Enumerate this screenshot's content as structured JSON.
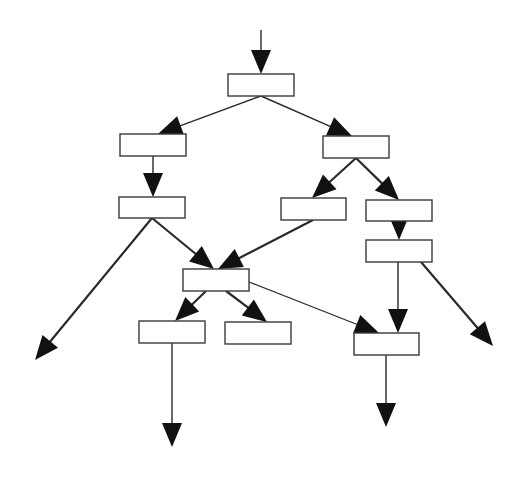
{
  "diagram": {
    "type": "flowchart-tree",
    "background": "#ffffff",
    "stroke_color": "#2a2a2a",
    "arrow_color": "#111111",
    "nodes": [
      {
        "id": "n1",
        "label": "",
        "x": 228,
        "y": 74,
        "w": 66,
        "h": 22
      },
      {
        "id": "n2",
        "label": "",
        "x": 120,
        "y": 134,
        "w": 66,
        "h": 22
      },
      {
        "id": "n3",
        "label": "",
        "x": 323,
        "y": 136,
        "w": 66,
        "h": 22
      },
      {
        "id": "n4",
        "label": "",
        "x": 119,
        "y": 197,
        "w": 66,
        "h": 21
      },
      {
        "id": "n5",
        "label": "",
        "x": 281,
        "y": 198,
        "w": 65,
        "h": 22
      },
      {
        "id": "n6",
        "label": "",
        "x": 366,
        "y": 200,
        "w": 66,
        "h": 21
      },
      {
        "id": "n7",
        "label": "",
        "x": 366,
        "y": 240,
        "w": 66,
        "h": 22
      },
      {
        "id": "n8",
        "label": "",
        "x": 183,
        "y": 269,
        "w": 66,
        "h": 22
      },
      {
        "id": "n9",
        "label": "",
        "x": 139,
        "y": 321,
        "w": 66,
        "h": 22
      },
      {
        "id": "n10",
        "label": "",
        "x": 225,
        "y": 322,
        "w": 66,
        "h": 22
      },
      {
        "id": "n11",
        "label": "",
        "x": 354,
        "y": 333,
        "w": 65,
        "h": 22
      }
    ],
    "edges": [
      {
        "from": "entry",
        "x1": 261,
        "y1": 30,
        "x2": 261,
        "y2": 74,
        "width": 1.4,
        "head": true
      },
      {
        "from": "n1",
        "to": "n2",
        "x1": 261,
        "y1": 96,
        "x2": 158,
        "y2": 134,
        "width": 1.4,
        "head": true
      },
      {
        "from": "n1",
        "to": "n3",
        "x1": 261,
        "y1": 96,
        "x2": 352,
        "y2": 136,
        "width": 1.4,
        "head": true
      },
      {
        "from": "n2",
        "to": "n4",
        "x1": 153,
        "y1": 156,
        "x2": 153,
        "y2": 197,
        "width": 1.4,
        "head": true
      },
      {
        "from": "n3",
        "to": "n5",
        "x1": 356,
        "y1": 158,
        "x2": 312,
        "y2": 198,
        "width": 2.2,
        "head": true
      },
      {
        "from": "n3",
        "to": "n6",
        "x1": 356,
        "y1": 158,
        "x2": 399,
        "y2": 200,
        "width": 2.2,
        "head": true
      },
      {
        "from": "n6",
        "to": "n7",
        "x1": 399,
        "y1": 221,
        "x2": 399,
        "y2": 240,
        "width": 1.4,
        "head": true
      },
      {
        "from": "n4",
        "to": "exit-left",
        "x1": 152,
        "y1": 218,
        "x2": 35,
        "y2": 360,
        "width": 2.2,
        "head": true
      },
      {
        "from": "n4",
        "to": "n8",
        "x1": 152,
        "y1": 218,
        "x2": 214,
        "y2": 269,
        "width": 2.2,
        "head": true
      },
      {
        "from": "n5",
        "to": "n8",
        "x1": 313,
        "y1": 220,
        "x2": 218,
        "y2": 269,
        "width": 2.2,
        "head": true
      },
      {
        "from": "n8",
        "to": "n9",
        "x1": 206,
        "y1": 291,
        "x2": 175,
        "y2": 321,
        "width": 2.2,
        "head": true
      },
      {
        "from": "n8",
        "to": "n10",
        "x1": 226,
        "y1": 291,
        "x2": 267,
        "y2": 322,
        "width": 2.2,
        "head": true
      },
      {
        "from": "n8",
        "to": "n11",
        "x1": 249,
        "y1": 282,
        "x2": 379,
        "y2": 333,
        "width": 1.2,
        "head": true
      },
      {
        "from": "n7",
        "to": "n11",
        "x1": 398,
        "y1": 262,
        "x2": 398,
        "y2": 333,
        "width": 1.4,
        "head": true
      },
      {
        "from": "n7",
        "to": "exit-right",
        "x1": 421,
        "y1": 262,
        "x2": 493,
        "y2": 346,
        "width": 2.2,
        "head": true
      },
      {
        "from": "n9",
        "to": "exit-bottom-left",
        "x1": 172,
        "y1": 343,
        "x2": 172,
        "y2": 447,
        "width": 1.4,
        "head": true
      },
      {
        "from": "n11",
        "to": "exit-bottom-right",
        "x1": 386,
        "y1": 355,
        "x2": 386,
        "y2": 427,
        "width": 1.4,
        "head": true
      }
    ]
  }
}
